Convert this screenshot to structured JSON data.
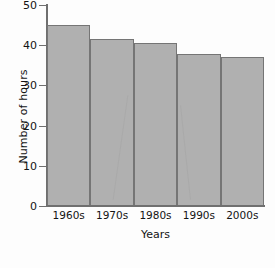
{
  "chart_data": {
    "type": "bar",
    "title": "",
    "xlabel": "Years",
    "ylabel": "Number of hours",
    "categories": [
      "1960s",
      "1970s",
      "1980s",
      "1990s",
      "2000s"
    ],
    "values": [
      45,
      41.5,
      40.5,
      37.8,
      37
    ],
    "ylim": [
      0,
      50
    ],
    "yticks": [
      0,
      10,
      20,
      30,
      40,
      50
    ],
    "ytick_labels": [
      "0",
      "10",
      "20",
      "30",
      "40",
      "50"
    ],
    "grid": false,
    "legend": null,
    "bar_fill_color": "#b0b0b0",
    "bar_edge_color": "#757575",
    "axis_color": "#6f6f6f",
    "background_color": "#fdfdfd"
  }
}
